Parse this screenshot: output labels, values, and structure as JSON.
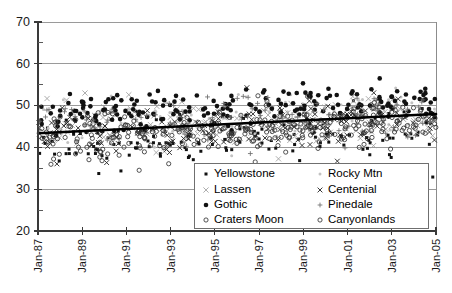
{
  "chart_data": {
    "type": "scatter",
    "title": "",
    "subtitle": "",
    "xlabel": "",
    "ylabel": "",
    "xlim": [
      "Jan-87",
      "Jan-05"
    ],
    "ylim": [
      20,
      70
    ],
    "y_ticks": [
      20,
      30,
      40,
      50,
      60,
      70
    ],
    "y_minor_ticks": [
      25,
      35,
      45,
      55,
      65
    ],
    "x_ticks": [
      "Jan-87",
      "Jan-89",
      "Jan-91",
      "Jan-93",
      "Jan-95",
      "Jan-97",
      "Jan-99",
      "Jan-01",
      "Jan-03",
      "Jan-05"
    ],
    "grid": "horizontal",
    "legend_position": "bottom-right-inside",
    "trendline": {
      "name": "overall-trend",
      "x_start": "Jan-87",
      "x_end": "Jan-05",
      "y_start": 43.4,
      "y_end": 48.0,
      "color": "#000000"
    },
    "series": [
      {
        "name": "Yellowstone",
        "marker": "small-filled-square",
        "color": "#111111",
        "mean": 42.5,
        "spread": 4.5,
        "trend_per_year": 0.2,
        "n": 150
      },
      {
        "name": "Rocky Mtn",
        "marker": "faint-dot",
        "color": "#c2c2c2",
        "mean": 47.0,
        "spread": 4.0,
        "trend_per_year": 0.18,
        "n": 130
      },
      {
        "name": "Lassen",
        "marker": "light-x",
        "color": "#9e9e9e",
        "mean": 45.5,
        "spread": 5.0,
        "trend_per_year": 0.15,
        "n": 140
      },
      {
        "name": "Centenial",
        "marker": "x",
        "color": "#222222",
        "mean": 45.0,
        "spread": 4.2,
        "trend_per_year": 0.22,
        "n": 150
      },
      {
        "name": "Gothic",
        "marker": "filled-circle",
        "color": "#111111",
        "mean": 49.5,
        "spread": 3.6,
        "trend_per_year": 0.2,
        "n": 200
      },
      {
        "name": "Pinedale",
        "marker": "plus",
        "color": "#6d6d6d",
        "mean": 46.5,
        "spread": 4.4,
        "trend_per_year": 0.18,
        "n": 120
      },
      {
        "name": "Craters Moon",
        "marker": "open-circle",
        "color": "#333333",
        "mean": 44.5,
        "spread": 4.0,
        "trend_per_year": 0.2,
        "n": 150
      },
      {
        "name": "Canyonlands",
        "marker": "open-circle",
        "color": "#333333",
        "mean": 43.8,
        "spread": 4.3,
        "trend_per_year": 0.2,
        "n": 140
      }
    ]
  },
  "legend": {
    "columns": [
      [
        {
          "label": "Yellowstone",
          "marker": "small-filled-square"
        },
        {
          "label": "Lassen",
          "marker": "light-x"
        },
        {
          "label": "Gothic",
          "marker": "filled-circle"
        },
        {
          "label": "Craters Moon",
          "marker": "open-circle"
        }
      ],
      [
        {
          "label": "Rocky Mtn",
          "marker": "faint-dot"
        },
        {
          "label": "Centenial",
          "marker": "x"
        },
        {
          "label": "Pinedale",
          "marker": "plus"
        },
        {
          "label": "Canyonlands",
          "marker": "open-circle"
        }
      ]
    ]
  }
}
